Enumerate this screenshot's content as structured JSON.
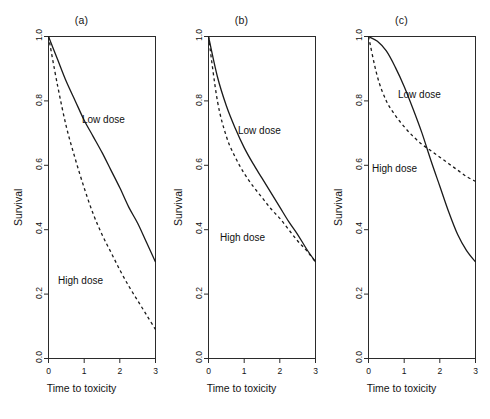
{
  "figure": {
    "background": "#ffffff",
    "ink": "#1a1a1a",
    "panel_count": 3
  },
  "axes": {
    "xlabel": "Time to toxicity",
    "ylabel": "Survival",
    "xticks": [
      "0",
      "1",
      "2",
      "3"
    ],
    "xtick_values": [
      0,
      1,
      2,
      3
    ],
    "yticks": [
      "0.0",
      "0.2",
      "0.4",
      "0.6",
      "0.8",
      "1.0"
    ],
    "ytick_values": [
      0.0,
      0.2,
      0.4,
      0.6,
      0.8,
      1.0
    ],
    "xlim": [
      0,
      3
    ],
    "ylim": [
      0,
      1
    ],
    "grid": false
  },
  "series_style": {
    "low_dose": "solid",
    "high_dose": "dashed"
  },
  "panels": [
    {
      "id": "a",
      "title": "(a)",
      "scenario": "proportional hazards",
      "labels": {
        "low": "Low dose",
        "high": "High dose"
      }
    },
    {
      "id": "b",
      "title": "(b)",
      "scenario": "converging hazards",
      "labels": {
        "low": "Low dose",
        "high": "High dose"
      }
    },
    {
      "id": "c",
      "title": "(c)",
      "scenario": "crossing hazards",
      "labels": {
        "low": "Low dose",
        "high": "High dose"
      }
    }
  ],
  "chart_data": [
    {
      "type": "line",
      "title": "(a)",
      "xlabel": "Time to toxicity",
      "ylabel": "Survival",
      "xlim": [
        0,
        3
      ],
      "ylim": [
        0,
        1
      ],
      "grid": false,
      "legend": "inline-annotations",
      "x": [
        0,
        0.25,
        0.5,
        0.75,
        1,
        1.25,
        1.5,
        1.75,
        2,
        2.25,
        2.5,
        2.75,
        3
      ],
      "series": [
        {
          "name": "Low dose",
          "style": "solid",
          "values": [
            1.0,
            0.93,
            0.86,
            0.8,
            0.74,
            0.69,
            0.64,
            0.585,
            0.53,
            0.47,
            0.42,
            0.36,
            0.3
          ]
        },
        {
          "name": "High dose",
          "style": "dashed",
          "values": [
            1.0,
            0.85,
            0.72,
            0.62,
            0.53,
            0.45,
            0.385,
            0.33,
            0.275,
            0.225,
            0.18,
            0.135,
            0.09
          ]
        }
      ]
    },
    {
      "type": "line",
      "title": "(b)",
      "xlabel": "Time to toxicity",
      "ylabel": "Survival",
      "xlim": [
        0,
        3
      ],
      "ylim": [
        0,
        1
      ],
      "grid": false,
      "legend": "inline-annotations",
      "x": [
        0,
        0.25,
        0.5,
        0.75,
        1,
        1.25,
        1.5,
        1.75,
        2,
        2.25,
        2.5,
        2.75,
        3
      ],
      "series": [
        {
          "name": "Low dose",
          "style": "solid",
          "values": [
            1.0,
            0.875,
            0.785,
            0.715,
            0.655,
            0.605,
            0.56,
            0.515,
            0.47,
            0.425,
            0.385,
            0.34,
            0.3
          ]
        },
        {
          "name": "High dose",
          "style": "dashed",
          "values": [
            1.0,
            0.8,
            0.69,
            0.625,
            0.575,
            0.535,
            0.5,
            0.465,
            0.435,
            0.4,
            0.365,
            0.335,
            0.3
          ]
        }
      ]
    },
    {
      "type": "line",
      "title": "(c)",
      "xlabel": "Time to toxicity",
      "ylabel": "Survival",
      "xlim": [
        0,
        3
      ],
      "ylim": [
        0,
        1
      ],
      "grid": false,
      "legend": "inline-annotations",
      "crossing_point": {
        "x": 1.65,
        "y": 0.62
      },
      "x": [
        0,
        0.25,
        0.5,
        0.75,
        1,
        1.25,
        1.5,
        1.75,
        2,
        2.25,
        2.5,
        2.75,
        3
      ],
      "series": [
        {
          "name": "Low dose",
          "style": "solid",
          "values": [
            1.0,
            0.985,
            0.955,
            0.905,
            0.845,
            0.775,
            0.7,
            0.615,
            0.535,
            0.455,
            0.385,
            0.335,
            0.3
          ]
        },
        {
          "name": "High dose",
          "style": "dashed",
          "values": [
            1.0,
            0.875,
            0.8,
            0.755,
            0.72,
            0.69,
            0.665,
            0.645,
            0.625,
            0.605,
            0.585,
            0.565,
            0.55
          ]
        }
      ]
    }
  ]
}
